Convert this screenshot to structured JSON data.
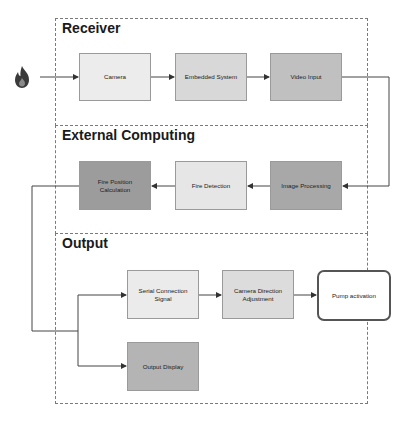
{
  "sections": [
    {
      "id": "receiver",
      "title": "Receiver"
    },
    {
      "id": "external",
      "title": "External Computing"
    },
    {
      "id": "output",
      "title": "Output"
    }
  ],
  "nodes": {
    "camera": {
      "label": "Camera",
      "color": "#ececec"
    },
    "embedded": {
      "label": "Embedded System",
      "color": "#d8d8d8"
    },
    "video_input": {
      "label": "Video Input",
      "color": "#c0c0c0"
    },
    "image_processing": {
      "label": "Image Processing",
      "color": "#a8a8a8"
    },
    "fire_detection": {
      "label": "Fire Detection",
      "color": "#e6e6e6"
    },
    "fire_position": {
      "label": "Fire Position Calculation",
      "color": "#9c9c9c"
    },
    "serial": {
      "label": "Serial Connection Signal",
      "color": "#ebebeb"
    },
    "camera_direction": {
      "label": "Camera Direction Adjustment",
      "color": "#dcdcdc"
    },
    "pump": {
      "label": "Pump activation",
      "color": "#ffffff"
    },
    "output_display": {
      "label": "Output Display",
      "color": "#b4b4b4"
    }
  },
  "source_icon": "fire-icon",
  "edges": [
    [
      "fire",
      "camera"
    ],
    [
      "camera",
      "embedded"
    ],
    [
      "embedded",
      "video_input"
    ],
    [
      "video_input",
      "image_processing"
    ],
    [
      "image_processing",
      "fire_detection"
    ],
    [
      "fire_detection",
      "fire_position"
    ],
    [
      "fire_position",
      "serial"
    ],
    [
      "fire_position",
      "output_display"
    ],
    [
      "serial",
      "camera_direction"
    ],
    [
      "camera_direction",
      "pump"
    ]
  ]
}
